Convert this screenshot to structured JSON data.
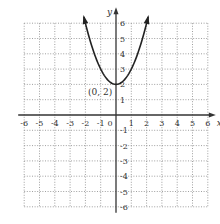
{
  "chart_data": {
    "type": "line",
    "title": "",
    "xlabel": "x",
    "ylabel": "y",
    "xlim": [
      -6,
      6
    ],
    "ylim": [
      -6,
      6
    ],
    "grid": true,
    "grid_style": "dotted",
    "x_ticks": [
      -6,
      -5,
      -4,
      -3,
      -2,
      -1,
      0,
      1,
      2,
      3,
      4,
      5,
      6
    ],
    "y_ticks": [
      -6,
      -5,
      -4,
      -3,
      -2,
      -1,
      1,
      2,
      3,
      4,
      5,
      6
    ],
    "x_tick_labels": [
      "-6",
      "-5",
      "-4",
      "-3",
      "-2",
      "-1",
      "0",
      "1",
      "2",
      "3",
      "4",
      "5",
      "6"
    ],
    "y_tick_labels": [
      "-6",
      "-5",
      "-4",
      "-3",
      "-2",
      "-1",
      "1",
      "2",
      "3",
      "4",
      "5",
      "6"
    ],
    "series": [
      {
        "name": "y = x^2 + 2",
        "function": "x^2 + 2",
        "x_range": [
          -2.1,
          2.1
        ],
        "x": [
          -2.1,
          -2,
          -1.5,
          -1,
          -0.5,
          0,
          0.5,
          1,
          1.5,
          2,
          2.1
        ],
        "y": [
          6.41,
          6,
          4.25,
          3,
          2.25,
          2,
          2.25,
          3,
          4.25,
          6,
          6.41
        ],
        "arrows_at_ends": true,
        "color": "#222222"
      }
    ],
    "annotations": [
      {
        "text": "(0, 2)",
        "x": 0,
        "y": 2,
        "position": "below-left"
      }
    ],
    "legend": null
  },
  "labels": {
    "x_axis": "x",
    "y_axis": "y",
    "vertex": "(0, 2)"
  },
  "colors": {
    "axis": "#333333",
    "grid": "#888888",
    "curve": "#222222"
  }
}
